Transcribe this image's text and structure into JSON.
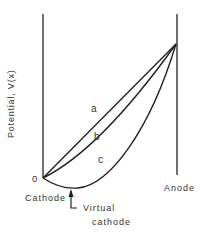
{
  "diagram": {
    "y_axis_label": "Potential,  V(x)",
    "origin_label": "0",
    "cathode_label": "Cathode",
    "anode_label": "Anode",
    "virtual_cathode_label_line1": "Virtual",
    "virtual_cathode_label_line2": "cathode",
    "curves": [
      {
        "id": "a",
        "label": "a",
        "description": "linear potential"
      },
      {
        "id": "b",
        "label": "b",
        "description": "space-charge limited, zero field at cathode"
      },
      {
        "id": "c",
        "label": "c",
        "description": "potential minimum (virtual cathode)"
      }
    ],
    "line_color": "#222222"
  }
}
